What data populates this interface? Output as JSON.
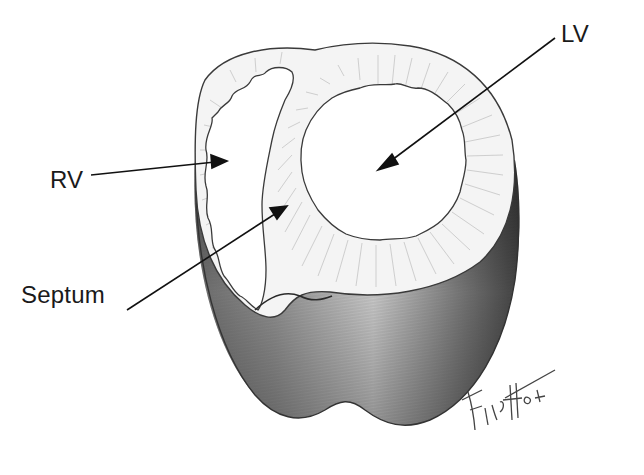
{
  "figure": {
    "labels": {
      "lv": "LV",
      "rv": "RV",
      "septum": "Septum"
    },
    "signature": {
      "artist": "Finch",
      "year": "84"
    }
  },
  "colors": {
    "background": "#ffffff",
    "ink": "#1a1a1a",
    "outline": "#3a3a3a",
    "hatch": "#9a9a9a",
    "shade_dark": "#4a4a4a",
    "shade_mid": "#8c8c8c",
    "shade_light": "#d9d9d9"
  }
}
